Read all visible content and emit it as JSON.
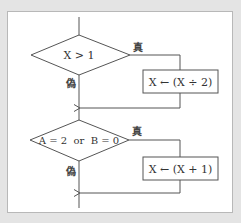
{
  "diagram": {
    "type": "flowchart",
    "colors": {
      "background": "#e4e4e4",
      "panel": "#ffffff",
      "stroke": "#555555",
      "text": "#333333"
    },
    "decisions": [
      {
        "id": "d1",
        "condition": "X > 1",
        "true_label": "真",
        "false_label": "偽"
      },
      {
        "id": "d2",
        "condition": "A = 2  or  B = 0",
        "true_label": "真",
        "false_label": "偽"
      }
    ],
    "processes": [
      {
        "id": "p1",
        "text": "X ← (X ÷ 2)"
      },
      {
        "id": "p2",
        "text": "X ← (X + 1)"
      }
    ]
  }
}
